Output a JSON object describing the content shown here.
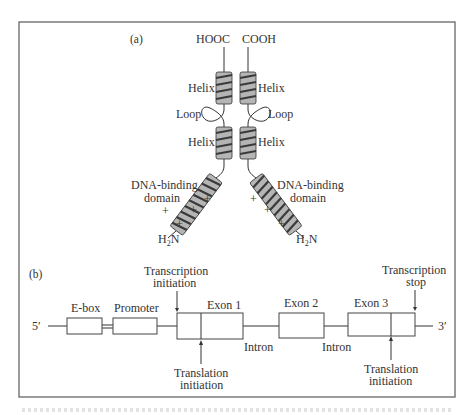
{
  "figure": {
    "panel_a": {
      "label": "(a)",
      "termini_top": {
        "left": "HOOC",
        "right": "COOH"
      },
      "helix_label": "Helix",
      "loop_label": "Loop",
      "dna_binding_label_line1": "DNA-binding",
      "dna_binding_label_line2": "domain",
      "n_terminus": {
        "main": "H",
        "sub": "2",
        "end": "N"
      },
      "charge_symbol": "+"
    },
    "panel_b": {
      "label": "(b)",
      "five_prime": "5′",
      "three_prime": "3′",
      "elements": [
        {
          "name": "E-box",
          "label": "E-box"
        },
        {
          "name": "Promoter",
          "label": "Promoter"
        },
        {
          "name": "Exon 1",
          "label": "Exon 1"
        },
        {
          "name": "Exon 2",
          "label": "Exon 2"
        },
        {
          "name": "Exon 3",
          "label": "Exon 3"
        }
      ],
      "introns": [
        "Intron",
        "Intron"
      ],
      "annotations": {
        "transcription_initiation": [
          "Transcription",
          "initiation"
        ],
        "translation_initiation_1": [
          "Translation",
          "initiation"
        ],
        "translation_initiation_3": [
          "Translation",
          "initiation"
        ],
        "transcription_stop": [
          "Transcription",
          "stop"
        ]
      }
    }
  }
}
